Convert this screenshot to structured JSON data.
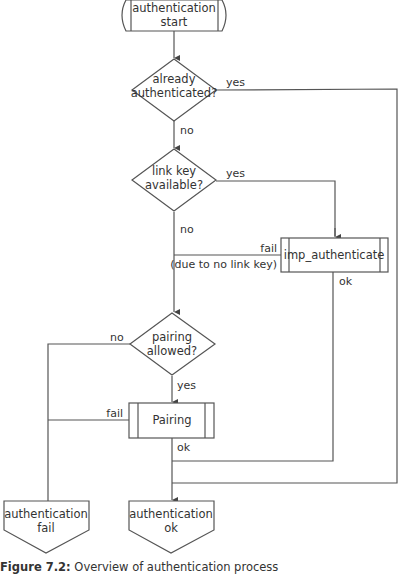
{
  "diagram": {
    "type": "flowchart",
    "nodes": {
      "start": {
        "label_line1": "authentication",
        "label_line2": "start",
        "shape": "terminator"
      },
      "already_auth": {
        "label_line1": "already",
        "label_line2": "authenticated?",
        "shape": "decision"
      },
      "link_key": {
        "label_line1": "link key",
        "label_line2": "available?",
        "shape": "decision"
      },
      "imp_auth": {
        "label": "imp_authenticate",
        "shape": "predefined-process"
      },
      "pairing_allowed": {
        "label_line1": "pairing",
        "label_line2": "allowed?",
        "shape": "decision"
      },
      "pairing": {
        "label": "Pairing",
        "shape": "predefined-process"
      },
      "auth_fail": {
        "label_line1": "authentication",
        "label_line2": "fail",
        "shape": "offpage-connector"
      },
      "auth_ok": {
        "label_line1": "authentication",
        "label_line2": "ok",
        "shape": "offpage-connector"
      }
    },
    "edges": {
      "already_yes": "yes",
      "already_no": "no",
      "link_yes": "yes",
      "link_no": "no",
      "imp_fail": "fail",
      "imp_fail_note": "(due to no link key)",
      "imp_ok": "ok",
      "pairing_allowed_no": "no",
      "pairing_allowed_yes": "yes",
      "pairing_fail": "fail",
      "pairing_ok": "ok"
    }
  },
  "caption": {
    "prefix": "Figure 7.2:",
    "text": " Overview of authentication process"
  }
}
